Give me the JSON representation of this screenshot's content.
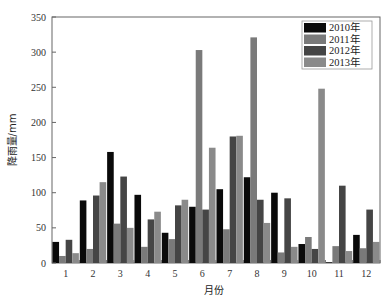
{
  "chart_data": {
    "type": "bar",
    "title": "",
    "xlabel": "月份",
    "ylabel": "降雨量/mm",
    "ylim": [
      0,
      350
    ],
    "yticks": [
      0,
      50,
      100,
      150,
      200,
      250,
      300,
      350
    ],
    "categories": [
      "1",
      "2",
      "3",
      "4",
      "5",
      "6",
      "7",
      "8",
      "9",
      "10",
      "11",
      "12"
    ],
    "grid": false,
    "legend_position": "upper right",
    "series": [
      {
        "name": "2010年",
        "color": "#0a0a0a",
        "values": [
          30,
          89,
          158,
          97,
          43,
          80,
          105,
          122,
          100,
          27,
          1,
          40
        ]
      },
      {
        "name": "2011年",
        "color": "#7a7a7a",
        "values": [
          10,
          20,
          56,
          23,
          34,
          303,
          48,
          321,
          15,
          37,
          24,
          21
        ]
      },
      {
        "name": "2012年",
        "color": "#454545",
        "values": [
          33,
          96,
          123,
          62,
          82,
          76,
          180,
          90,
          92,
          20,
          110,
          76
        ]
      },
      {
        "name": "2013年",
        "color": "#8a8a8a",
        "values": [
          14,
          115,
          50,
          73,
          90,
          164,
          181,
          57,
          23,
          248,
          17,
          30
        ]
      }
    ]
  }
}
